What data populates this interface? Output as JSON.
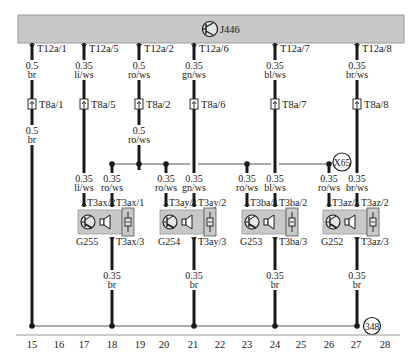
{
  "control_unit": {
    "id": "J446",
    "fill": "#c8c8c8"
  },
  "connectors_top": [
    {
      "x": 32,
      "pin": "T12a/1",
      "size": "0.5",
      "color": "br"
    },
    {
      "x": 84,
      "pin": "T12a/5",
      "size": "0.35",
      "color": "li/ws"
    },
    {
      "x": 139,
      "pin": "T12a/2",
      "size": "0.5",
      "color": "ro/ws"
    },
    {
      "x": 194,
      "pin": "T12a/6",
      "size": "0.35",
      "color": "gn/ws"
    },
    {
      "x": 275,
      "pin": "T12a/7",
      "size": "0.35",
      "color": "bl/ws"
    },
    {
      "x": 357,
      "pin": "T12a/8",
      "size": "0.35",
      "color": "br/ws"
    }
  ],
  "connectors_mid": [
    {
      "x": 32,
      "pin": "T8a/1"
    },
    {
      "x": 84,
      "pin": "T8a/5"
    },
    {
      "x": 139,
      "pin": "T8a/2"
    },
    {
      "x": 194,
      "pin": "T8a/6"
    },
    {
      "x": 275,
      "pin": "T8a/7"
    },
    {
      "x": 357,
      "pin": "T8a/8"
    }
  ],
  "mid_labels": [
    {
      "x": 32,
      "size": "0.5",
      "color": "br"
    },
    {
      "x": 139,
      "size": "0.5",
      "color": "ro/ws"
    }
  ],
  "branch_labels": [
    {
      "x": 84,
      "size": "0.35",
      "color": "li/ws"
    },
    {
      "x": 112,
      "size": "0.35",
      "color": "ro/ws"
    },
    {
      "x": 166,
      "size": "0.35",
      "color": "ro/ws"
    },
    {
      "x": 194,
      "size": "0.35",
      "color": "gn/ws"
    },
    {
      "x": 247,
      "size": "0.35",
      "color": "ro/ws"
    },
    {
      "x": 275,
      "size": "0.35",
      "color": "bl/ws"
    },
    {
      "x": 329,
      "size": "0.35",
      "color": "ro/ws"
    },
    {
      "x": 357,
      "size": "0.35",
      "color": "br/ws"
    }
  ],
  "splice": {
    "id": "X65"
  },
  "sensors": [
    {
      "id": "G255",
      "x": 78,
      "pin1": "T3ax/2",
      "pin2": "T3ax/1",
      "pin3": "T3ax/3"
    },
    {
      "id": "G254",
      "x": 160,
      "pin1": "T3ay/1",
      "pin2": "T3ay/2",
      "pin3": "T3ay/3"
    },
    {
      "id": "G253",
      "x": 242,
      "pin1": "T3ba/1",
      "pin2": "T3ba/2",
      "pin3": "T3ba/3"
    },
    {
      "id": "G252",
      "x": 323,
      "pin1": "T3az/1",
      "pin2": "T3az/2",
      "pin3": "T3az/3"
    }
  ],
  "ground_labels": [
    {
      "x": 112,
      "size": "0.35",
      "color": "br"
    },
    {
      "x": 194,
      "size": "0.35",
      "color": "br"
    },
    {
      "x": 275,
      "size": "0.35",
      "color": "br"
    },
    {
      "x": 357,
      "size": "0.35",
      "color": "br"
    }
  ],
  "ground_point": {
    "id": "348"
  },
  "columns": [
    {
      "n": "15",
      "x": 32
    },
    {
      "n": "16",
      "x": 59
    },
    {
      "n": "17",
      "x": 84
    },
    {
      "n": "18",
      "x": 112
    },
    {
      "n": "19",
      "x": 140
    },
    {
      "n": "20",
      "x": 164
    },
    {
      "n": "21",
      "x": 193
    },
    {
      "n": "22",
      "x": 220
    },
    {
      "n": "23",
      "x": 247
    },
    {
      "n": "24",
      "x": 275
    },
    {
      "n": "25",
      "x": 301
    },
    {
      "n": "26",
      "x": 329
    },
    {
      "n": "27",
      "x": 356
    },
    {
      "n": "28",
      "x": 385
    }
  ]
}
